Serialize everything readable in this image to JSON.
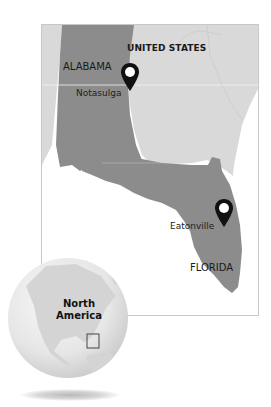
{
  "map": {
    "country_label": "UNITED STATES",
    "states": [
      {
        "name": "ALABAMA"
      },
      {
        "name": "FLORIDA"
      }
    ],
    "cities": [
      {
        "name": "Notasulga",
        "marker": "map-pin-icon"
      },
      {
        "name": "Eatonville",
        "marker": "map-pin-icon"
      }
    ],
    "colors": {
      "highlight_states": "#8c8c8c",
      "other_land": "#d9d9d9",
      "water": "#ffffff",
      "frame_border": "#c8c8c8",
      "pin": "#111111"
    }
  },
  "inset": {
    "region_label_line1": "North",
    "region_label_line2": "America",
    "locator_box": "locator-rectangle-icon"
  }
}
